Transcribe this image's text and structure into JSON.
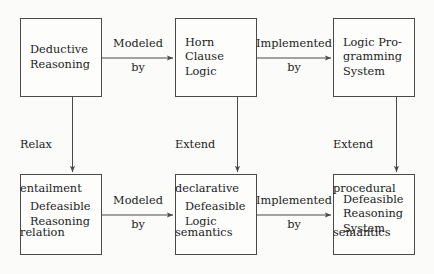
{
  "diagram": {
    "background_color": "#fbfbf9",
    "stroke_color": "#4a4a48",
    "text_color": "#1b1b1b",
    "nodes": [
      {
        "id": "deductive-reasoning",
        "lines": [
          "Deductive",
          "Reasoning"
        ],
        "row": "top",
        "column": 1
      },
      {
        "id": "horn-clause-logic",
        "lines": [
          "Horn",
          "Clause",
          "Logic"
        ],
        "row": "top",
        "column": 2
      },
      {
        "id": "logic-programming-system",
        "lines": [
          "Logic Pro-",
          "gramming",
          "System"
        ],
        "row": "top",
        "column": 3
      },
      {
        "id": "defeasible-reasoning",
        "lines": [
          "Defeasible",
          "Reasoning"
        ],
        "row": "bottom",
        "column": 1
      },
      {
        "id": "defeasible-logic",
        "lines": [
          "Defeasible",
          "Logic"
        ],
        "row": "bottom",
        "column": 2
      },
      {
        "id": "defeasible-reasoning-system",
        "lines": [
          "Defeasible",
          "Reasoning",
          "System"
        ],
        "row": "bottom",
        "column": 3
      }
    ],
    "edges": [
      {
        "id": "top-modeled-by",
        "from": "deductive-reasoning",
        "to": "horn-clause-logic",
        "direction": "horizontal",
        "label_above": "Modeled",
        "label_below": "by"
      },
      {
        "id": "top-implemented-by",
        "from": "horn-clause-logic",
        "to": "logic-programming-system",
        "direction": "horizontal",
        "label_above": "Implemented",
        "label_below": "by"
      },
      {
        "id": "bottom-modeled-by",
        "from": "defeasible-reasoning",
        "to": "defeasible-logic",
        "direction": "horizontal",
        "label_above": "Modeled",
        "label_below": "by"
      },
      {
        "id": "bottom-implemented-by",
        "from": "defeasible-logic",
        "to": "defeasible-reasoning-system",
        "direction": "horizontal",
        "label_above": "Implemented",
        "label_below": "by"
      },
      {
        "id": "relax-entailment-relation",
        "from": "deductive-reasoning",
        "to": "defeasible-reasoning",
        "direction": "vertical",
        "label_lines": [
          "Relax",
          "entailment",
          "relation"
        ]
      },
      {
        "id": "extend-declarative-semantics",
        "from": "horn-clause-logic",
        "to": "defeasible-logic",
        "direction": "vertical",
        "label_lines": [
          "Extend",
          "declarative",
          "semantics"
        ]
      },
      {
        "id": "extend-procedural-semantics",
        "from": "logic-programming-system",
        "to": "defeasible-reasoning-system",
        "direction": "vertical",
        "label_lines": [
          "Extend",
          "procedural",
          "semantics"
        ]
      }
    ]
  }
}
